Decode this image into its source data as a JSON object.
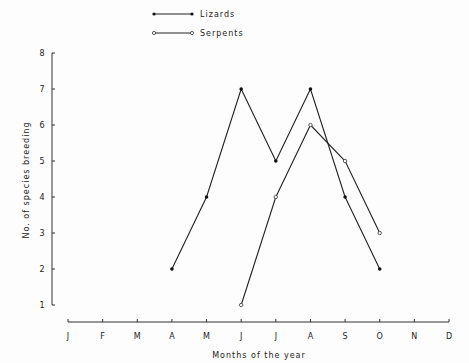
{
  "chart_data": {
    "type": "line",
    "title": "",
    "xlabel": "Months of the year",
    "ylabel": "No. of species breeding",
    "categories": [
      "J",
      "F",
      "M",
      "A",
      "M",
      "J",
      "J",
      "A",
      "S",
      "O",
      "N",
      "D"
    ],
    "ylim": [
      1,
      8
    ],
    "yticks": [
      1,
      2,
      3,
      4,
      5,
      6,
      7,
      8
    ],
    "grid": false,
    "legend_position": "top",
    "series": [
      {
        "name": "Lizards",
        "marker": "filled-circle",
        "points": [
          {
            "month_index": 3,
            "month": "A",
            "value": 2
          },
          {
            "month_index": 4,
            "month": "M",
            "value": 4
          },
          {
            "month_index": 5,
            "month": "J",
            "value": 7
          },
          {
            "month_index": 6,
            "month": "J",
            "value": 5
          },
          {
            "month_index": 7,
            "month": "A",
            "value": 7
          },
          {
            "month_index": 8,
            "month": "S",
            "value": 4
          },
          {
            "month_index": 9,
            "month": "O",
            "value": 2
          }
        ]
      },
      {
        "name": "Serpents",
        "marker": "open-circle",
        "points": [
          {
            "month_index": 5,
            "month": "J",
            "value": 1
          },
          {
            "month_index": 6,
            "month": "J",
            "value": 4
          },
          {
            "month_index": 7,
            "month": "A",
            "value": 6
          },
          {
            "month_index": 8,
            "month": "S",
            "value": 5
          },
          {
            "month_index": 9,
            "month": "O",
            "value": 3
          }
        ]
      }
    ]
  },
  "legend": {
    "lizards": "Lizards",
    "serpents": "Serpents"
  },
  "axes": {
    "xlabel": "Months of the year",
    "ylabel": "No. of species breeding"
  }
}
